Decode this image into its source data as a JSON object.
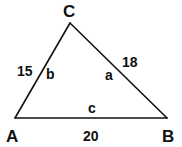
{
  "diagram": {
    "type": "triangle",
    "vertices": [
      {
        "id": "A",
        "label": "A"
      },
      {
        "id": "B",
        "label": "B"
      },
      {
        "id": "C",
        "label": "C"
      }
    ],
    "sides": [
      {
        "id": "b",
        "from": "A",
        "to": "C",
        "letter": "b",
        "length": "15"
      },
      {
        "id": "a",
        "from": "C",
        "to": "B",
        "letter": "a",
        "length": "18"
      },
      {
        "id": "c",
        "from": "A",
        "to": "B",
        "letter": "c",
        "length": "20"
      }
    ],
    "colors": {
      "stroke": "#111111",
      "background": "#ffffff"
    }
  }
}
